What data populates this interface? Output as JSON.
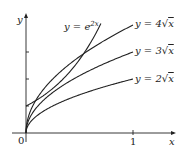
{
  "chart_data": {
    "type": "line",
    "title": "",
    "xlabel": "x",
    "ylabel": "y",
    "xlim": [
      0,
      1.1
    ],
    "ylim": [
      0,
      4.3
    ],
    "x_ticks": [
      {
        "value": 1,
        "label": "1"
      }
    ],
    "y_ticks": [
      1,
      2,
      3
    ],
    "origin_label": "0",
    "grid": false,
    "series": [
      {
        "name": "y = e^{2x}",
        "label_main": "y = e",
        "label_sup": "2x",
        "function": "exp(2x)",
        "x_range": [
          0,
          0.7
        ]
      },
      {
        "name": "y = 4√x",
        "label_main": "y = 4",
        "function": "4*sqrt(x)",
        "x_range": [
          0,
          1
        ]
      },
      {
        "name": "y = 3√x",
        "label_main": "y = 3",
        "function": "3*sqrt(x)",
        "x_range": [
          0,
          1
        ]
      },
      {
        "name": "y = 2√x",
        "label_main": "y = 2",
        "function": "2*sqrt(x)",
        "x_range": [
          0,
          1
        ]
      }
    ],
    "line_color": "#222222"
  }
}
